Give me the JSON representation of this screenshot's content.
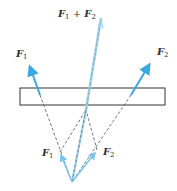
{
  "diagram": {
    "type": "force-vector-addition",
    "labels": {
      "sum_F": "F",
      "sum_sub1": "1",
      "sum_plus": " + ",
      "sum_F2": "F",
      "sum_sub2": "2",
      "top_left_F": "F",
      "top_left_sub": "1",
      "top_right_F": "F",
      "top_right_sub": "2",
      "bottom_left_F": "F",
      "bottom_left_sub": "1",
      "bottom_right_F": "F",
      "bottom_right_sub": "2"
    },
    "colors": {
      "force_arrow": "#3aa8e0",
      "resultant_dashed": "#9fd3ea",
      "construction_dashed": "#555555",
      "body_outline": "#333333",
      "label_text": "#333333"
    },
    "elements": [
      {
        "name": "body",
        "shape": "rectangle",
        "x": 20,
        "y": 88,
        "w": 145,
        "h": 17
      },
      {
        "name": "force-F1",
        "from": [
          40,
          95
        ],
        "to": [
          28,
          62
        ]
      },
      {
        "name": "force-F2",
        "from": [
          131,
          95
        ],
        "to": [
          152,
          60
        ]
      },
      {
        "name": "resultant-F1+F2",
        "from": [
          88,
          103
        ],
        "to": [
          101,
          18
        ],
        "style": "dashed"
      },
      {
        "name": "small-F1",
        "from": [
          72,
          182
        ],
        "to": [
          60,
          152
        ]
      },
      {
        "name": "small-F2",
        "from": [
          72,
          182
        ],
        "to": [
          97,
          150
        ]
      },
      {
        "name": "construction-apex",
        "point": [
          86,
          110
        ]
      }
    ]
  }
}
